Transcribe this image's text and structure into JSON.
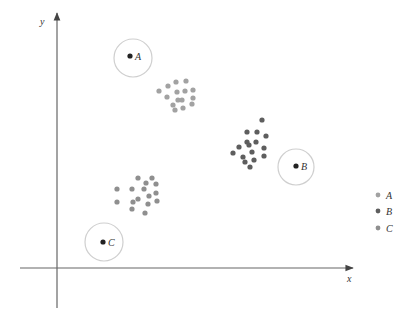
{
  "axes": {
    "x_label": "x",
    "y_label": "y",
    "color": "#555555"
  },
  "centroids": [
    {
      "label": "A",
      "cx": 130,
      "cy": 56,
      "circle_cx": 133,
      "circle_cy": 58,
      "r": 19
    },
    {
      "label": "B",
      "cx": 296,
      "cy": 166,
      "circle_cx": 296,
      "circle_cy": 167,
      "r": 18
    },
    {
      "label": "C",
      "cx": 103,
      "cy": 242,
      "circle_cx": 104,
      "circle_cy": 242,
      "r": 19
    }
  ],
  "clusters": [
    {
      "label": "A",
      "color": "#a2a2a2",
      "points": [
        [
          159,
          91
        ],
        [
          168,
          86
        ],
        [
          176,
          82
        ],
        [
          186,
          81
        ],
        [
          167,
          97
        ],
        [
          177,
          92
        ],
        [
          185,
          91
        ],
        [
          193,
          90
        ],
        [
          178,
          100
        ],
        [
          182,
          100
        ],
        [
          193,
          98
        ],
        [
          173,
          105
        ],
        [
          175,
          110
        ],
        [
          183,
          108
        ],
        [
          192,
          104
        ]
      ]
    },
    {
      "label": "B",
      "color": "#5e5e5e",
      "points": [
        [
          262,
          120
        ],
        [
          247,
          132
        ],
        [
          257,
          132
        ],
        [
          266,
          136
        ],
        [
          247,
          142
        ],
        [
          256,
          142
        ],
        [
          239,
          147
        ],
        [
          249,
          145
        ],
        [
          264,
          148
        ],
        [
          233,
          153
        ],
        [
          252,
          152
        ],
        [
          243,
          157
        ],
        [
          264,
          156
        ],
        [
          254,
          160
        ],
        [
          245,
          162
        ],
        [
          250,
          167
        ]
      ]
    },
    {
      "label": "C",
      "color": "#8f8f8f",
      "points": [
        [
          138,
          178
        ],
        [
          152,
          178
        ],
        [
          146,
          183
        ],
        [
          156,
          184
        ],
        [
          117,
          189
        ],
        [
          132,
          189
        ],
        [
          144,
          189
        ],
        [
          156,
          193
        ],
        [
          149,
          196
        ],
        [
          138,
          199
        ],
        [
          133,
          202
        ],
        [
          117,
          202
        ],
        [
          157,
          201
        ],
        [
          148,
          204
        ],
        [
          132,
          209
        ],
        [
          145,
          213
        ]
      ]
    }
  ],
  "legend": [
    {
      "label": "A",
      "color": "#a2a2a2"
    },
    {
      "label": "B",
      "color": "#5e5e5e"
    },
    {
      "label": "C",
      "color": "#8f8f8f"
    }
  ]
}
